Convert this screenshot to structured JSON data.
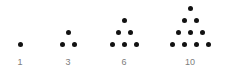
{
  "figure": {
    "name": "triangular-numbers-dot-diagram",
    "background_color": "#ffffff",
    "dot_color": "#121212",
    "label_color": "#7d7d7d",
    "dot_diameter_px": 5,
    "dot_spacing_x_px": 12,
    "dot_spacing_y_px": 12,
    "baseline_y_px": 44,
    "label_y_px": 57,
    "groups": [
      {
        "label": "1",
        "rows": 1,
        "dot_count": 1,
        "center_x": 20,
        "dots": [
          {
            "x": 20,
            "y": 44
          }
        ]
      },
      {
        "label": "3",
        "rows": 2,
        "dot_count": 3,
        "center_x": 68,
        "dots": [
          {
            "x": 68,
            "y": 32
          },
          {
            "x": 62,
            "y": 44
          },
          {
            "x": 74,
            "y": 44
          }
        ]
      },
      {
        "label": "6",
        "rows": 3,
        "dot_count": 6,
        "center_x": 124,
        "dots": [
          {
            "x": 124,
            "y": 20
          },
          {
            "x": 118,
            "y": 32
          },
          {
            "x": 130,
            "y": 32
          },
          {
            "x": 112,
            "y": 44
          },
          {
            "x": 124,
            "y": 44
          },
          {
            "x": 136,
            "y": 44
          }
        ]
      },
      {
        "label": "10",
        "rows": 4,
        "dot_count": 10,
        "center_x": 190,
        "dots": [
          {
            "x": 190,
            "y": 8
          },
          {
            "x": 184,
            "y": 20
          },
          {
            "x": 196,
            "y": 20
          },
          {
            "x": 178,
            "y": 32
          },
          {
            "x": 190,
            "y": 32
          },
          {
            "x": 202,
            "y": 32
          },
          {
            "x": 172,
            "y": 44
          },
          {
            "x": 184,
            "y": 44
          },
          {
            "x": 196,
            "y": 44
          },
          {
            "x": 208,
            "y": 44
          }
        ]
      }
    ]
  },
  "chart_data": {
    "type": "scatter",
    "title": "",
    "subtitle": "",
    "xlabel": "",
    "ylabel": "",
    "grid": false,
    "legend": null,
    "annotations": [],
    "categories": [
      "1",
      "3",
      "6",
      "10"
    ],
    "values": [
      1,
      3,
      6,
      10
    ],
    "series": [
      {
        "name": "triangular numbers",
        "values": [
          1,
          3,
          6,
          10
        ]
      },
      {
        "name": "rows per figure",
        "values": [
          1,
          2,
          3,
          4
        ]
      }
    ],
    "tick_labels": [
      "1",
      "3",
      "6",
      "10"
    ]
  }
}
